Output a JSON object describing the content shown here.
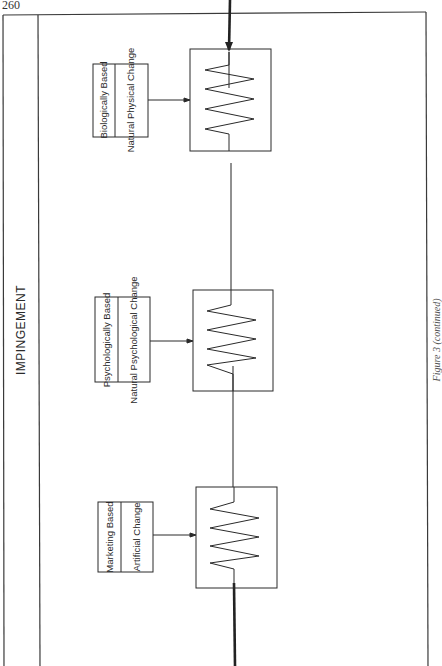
{
  "page": {
    "number": "260"
  },
  "frame": {
    "title": "IMPINGEMENT"
  },
  "sources": [
    {
      "id": "biological",
      "based_label": "Biologically Based",
      "change_label": "Natural Physical Change"
    },
    {
      "id": "psychological",
      "based_label": "Psychologically Based",
      "change_label": "Natural Psychological Change"
    },
    {
      "id": "marketing",
      "based_label": "Marketing Based",
      "change_label": "Artificial Change"
    }
  ],
  "resistors": [
    {
      "id": "resistor-biological"
    },
    {
      "id": "resistor-psychological"
    },
    {
      "id": "resistor-marketing"
    }
  ],
  "caption": "Figure 3 (continued)",
  "colors": {
    "line": "#2a2a2a",
    "background": "#ffffff"
  }
}
